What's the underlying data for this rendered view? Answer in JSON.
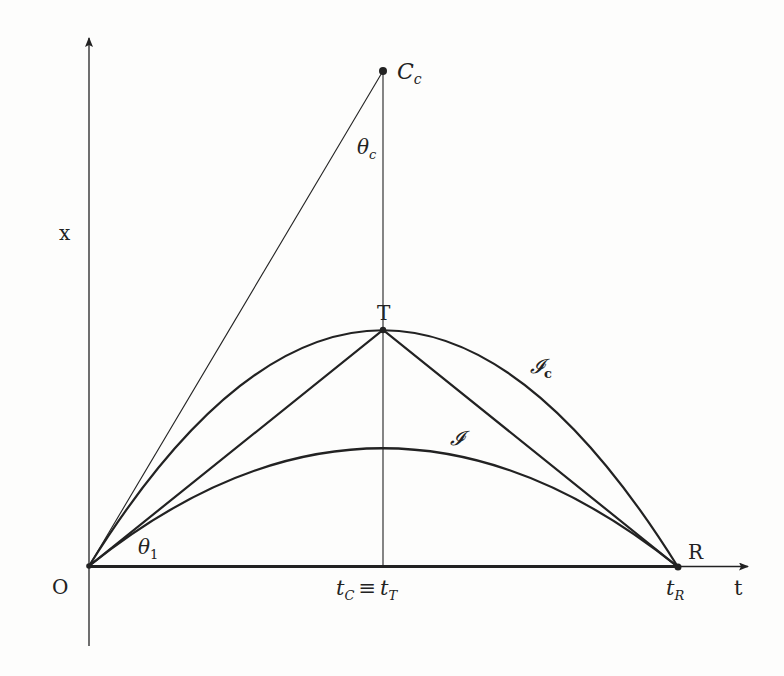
{
  "figure": {
    "type": "spacetime-diagram",
    "colors": {
      "background": "#fdfdfc",
      "ink": "#222222"
    },
    "axes": {
      "vertical_label": "x",
      "horizontal_label": "t",
      "origin_label": "O"
    },
    "points": {
      "Cc": {
        "label_main": "C",
        "label_sub": "c"
      },
      "T": {
        "label": "T"
      },
      "R": {
        "label": "R"
      },
      "O": {
        "label": "O"
      }
    },
    "angles": {
      "theta_c": {
        "main": "θ",
        "sub": "c"
      },
      "theta_1": {
        "main": "θ",
        "sub": "1"
      }
    },
    "curves": {
      "Ic": {
        "main": "𝓘",
        "sub": "c"
      },
      "I": {
        "main": "𝓘"
      }
    },
    "tick_labels": {
      "tC": {
        "main": "t",
        "sub": "C"
      },
      "equiv": "≡",
      "tT": {
        "main": "t",
        "sub": "T"
      },
      "tR": {
        "main": "t",
        "sub": "R"
      }
    }
  }
}
